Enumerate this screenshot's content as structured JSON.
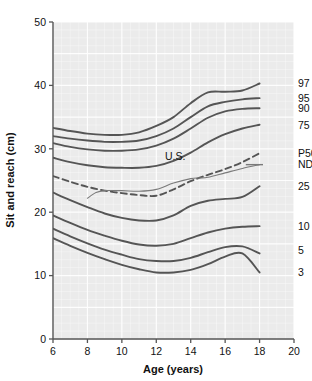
{
  "chart_data": {
    "type": "line",
    "title": "",
    "xlabel": "Age (years)",
    "ylabel": "Sit and reach (cm)",
    "xlim": [
      6,
      20
    ],
    "ylim": [
      0,
      50
    ],
    "xticks": [
      6,
      8,
      10,
      12,
      14,
      16,
      18,
      20
    ],
    "yticks": [
      0,
      10,
      20,
      30,
      40,
      50
    ],
    "grid": true,
    "grid_color": "#ffffff",
    "plot_background": "#ebebeb",
    "line_color": "#555555",
    "legend_position": "right-of-curve-ends",
    "x": [
      6,
      7,
      8,
      9,
      10,
      11,
      12,
      13,
      14,
      15,
      16,
      17,
      18
    ],
    "series": [
      {
        "name": "97",
        "label": "97",
        "style": "solid",
        "values": [
          33.3,
          32.8,
          32.4,
          32.2,
          32.2,
          32.6,
          33.6,
          35.0,
          37.2,
          38.9,
          39.0,
          39.2,
          40.3
        ]
      },
      {
        "name": "95",
        "label": "95",
        "style": "solid",
        "values": [
          32.0,
          31.6,
          31.3,
          31.1,
          31.1,
          31.3,
          32.0,
          33.2,
          35.0,
          36.7,
          37.4,
          37.8,
          38.0
        ]
      },
      {
        "name": "90",
        "label": "90",
        "style": "solid",
        "values": [
          30.9,
          30.3,
          29.9,
          29.7,
          29.7,
          29.9,
          30.5,
          31.6,
          33.2,
          34.9,
          35.9,
          36.3,
          36.4
        ]
      },
      {
        "name": "75",
        "label": "75",
        "style": "solid",
        "values": [
          28.6,
          27.9,
          27.4,
          27.1,
          27.0,
          27.0,
          27.3,
          28.1,
          29.4,
          31.0,
          32.3,
          33.2,
          33.8
        ]
      },
      {
        "name": "P50",
        "label": "P50",
        "style": "dashed",
        "values": [
          25.7,
          24.8,
          24.0,
          23.4,
          23.0,
          22.7,
          22.6,
          23.6,
          24.9,
          25.9,
          26.8,
          27.9,
          29.3
        ]
      },
      {
        "name": "25",
        "label": "25",
        "style": "solid",
        "values": [
          23.1,
          21.9,
          20.8,
          19.8,
          19.1,
          18.7,
          18.7,
          19.5,
          21.0,
          21.8,
          22.1,
          22.4,
          24.1
        ]
      },
      {
        "name": "10",
        "label": "10",
        "style": "solid",
        "values": [
          19.5,
          18.3,
          17.2,
          16.3,
          15.5,
          14.9,
          14.7,
          15.0,
          15.9,
          16.8,
          17.4,
          17.7,
          17.8
        ]
      },
      {
        "name": "5",
        "label": "5",
        "style": "solid",
        "values": [
          17.4,
          16.2,
          15.1,
          14.1,
          13.3,
          12.6,
          12.3,
          12.3,
          12.8,
          13.7,
          14.5,
          14.6,
          13.5
        ]
      },
      {
        "name": "3",
        "label": "3",
        "style": "solid",
        "values": [
          15.9,
          14.7,
          13.6,
          12.6,
          11.7,
          11.0,
          10.5,
          10.5,
          10.9,
          11.8,
          13.0,
          13.5,
          10.5
        ]
      }
    ],
    "reference_lines": [
      {
        "name": "U.S.",
        "label": "U.S.",
        "style": "solid-thin",
        "x": [
          8,
          8.5,
          9,
          10,
          11,
          12,
          13,
          14,
          14.5,
          15,
          16,
          17,
          18
        ],
        "values": [
          22.2,
          23.1,
          23.4,
          23.4,
          23.3,
          23.6,
          24.6,
          25.3,
          25.4,
          25.5,
          26.2,
          26.9,
          27.5
        ]
      }
    ],
    "annotations": [
      {
        "text": "U.S.",
        "x": 13.1,
        "y": 28.2
      },
      {
        "text": "NDL",
        "x": 18.4,
        "y": 27.5
      }
    ],
    "curve_end_labels": [
      {
        "text": "97",
        "y": 40.3
      },
      {
        "text": "95",
        "y": 38.0
      },
      {
        "text": "90",
        "y": 36.4
      },
      {
        "text": "75",
        "y": 33.8
      },
      {
        "text": "P50",
        "y": 29.3
      },
      {
        "text": "NDL",
        "y": 27.5
      },
      {
        "text": "25",
        "y": 24.1
      },
      {
        "text": "10",
        "y": 17.8
      },
      {
        "text": "5",
        "y": 14.0
      },
      {
        "text": "3",
        "y": 10.5
      }
    ]
  }
}
